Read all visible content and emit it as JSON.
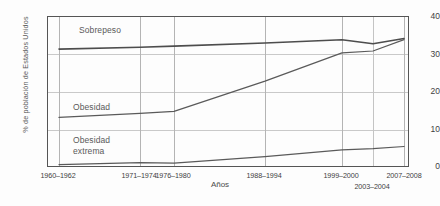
{
  "chart_data": {
    "type": "line",
    "title": "",
    "xlabel": "Años",
    "ylabel": "% de población de Estados Unidos",
    "categories": [
      "1960-1962",
      "1971-1974",
      "1976-1980",
      "1988-1994",
      "1999-2000",
      "2003-2004",
      "2007-2008"
    ],
    "xtick_labels": [
      "1960–1962",
      "1971–1974",
      "1976–1980",
      "1988–1994",
      "1999–2000",
      "2003–2004",
      "2007–2008"
    ],
    "ytick_labels": [
      "0",
      "10",
      "20",
      "30",
      "40"
    ],
    "ytick_values": [
      0,
      10,
      20,
      30,
      40
    ],
    "ylim": [
      0,
      40
    ],
    "grid": "both",
    "legend": "inline-annotations",
    "series": [
      {
        "name": "Sobrepeso",
        "label": "Sobrepeso",
        "color": "#4d4d4d",
        "values": [
          31.5,
          32.0,
          32.3,
          33.1,
          34.0,
          32.9,
          34.3
        ]
      },
      {
        "name": "Obesidad",
        "label": "Obesidad",
        "color": "#5a5a5a",
        "values": [
          13.4,
          14.5,
          15.0,
          23.0,
          30.5,
          31.0,
          34.0
        ]
      },
      {
        "name": "Obesidad extrema",
        "label": "Obesidad\nextrema",
        "color": "#5a5a5a",
        "values": [
          0.9,
          1.4,
          1.3,
          3.0,
          4.8,
          5.1,
          5.7
        ]
      }
    ]
  },
  "axes": {
    "y_title": "% de población de Estados Unidos",
    "x_title": "Años"
  },
  "annotations": {
    "sobrepeso": "Sobrepeso",
    "obesidad": "Obesidad",
    "obesidad_extrema": "Obesidad\nextrema"
  }
}
